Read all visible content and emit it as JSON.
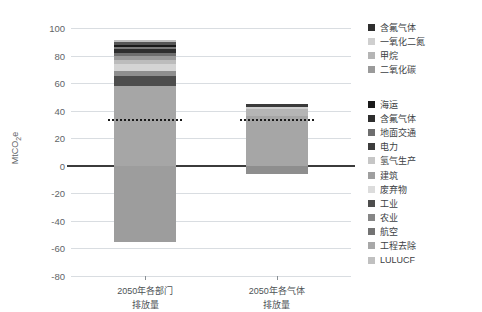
{
  "chart_data": {
    "type": "bar",
    "title": "",
    "subtitle": "",
    "xlabel": "",
    "ylabel": "MtCO2e",
    "ylim": [
      -80,
      100
    ],
    "yticks": [
      100,
      80,
      60,
      40,
      20,
      0,
      -20,
      -40,
      -60,
      -80
    ],
    "grid": true,
    "stacked": true,
    "legend_position": "right",
    "categories": [
      "2050年各部门\n排放量",
      "2050年各气体\n排放量"
    ],
    "annotations": [
      {
        "name": "net-emissions-line-sector",
        "label": "",
        "value": 34,
        "style": "dotted",
        "series": "2050年各部门排放量"
      },
      {
        "name": "net-emissions-line-gas",
        "label": "",
        "value": 34,
        "style": "dotted",
        "series": "2050年各气体排放量"
      }
    ],
    "bars": [
      {
        "name": "2050年各部门排放量",
        "x_label_line1": "2050年各部门",
        "x_label_line2": "排放量",
        "net_value": 34,
        "segments": [
          {
            "label": "工业",
            "value": 58.0,
            "y0": 0.0,
            "y1": 58.0,
            "color": "#a6a6a6"
          },
          {
            "label": "农业",
            "value": 7.0,
            "y0": 58.0,
            "y1": 65.0,
            "color": "#4d4d4d"
          },
          {
            "label": "废弃物",
            "value": 4.0,
            "y0": 65.0,
            "y1": 69.0,
            "color": "#8f8f8f"
          },
          {
            "label": "建筑",
            "value": 5.0,
            "y0": 69.0,
            "y1": 74.0,
            "color": "#d4d4d4"
          },
          {
            "label": "氢气生产",
            "value": 3.0,
            "y0": 74.0,
            "y1": 77.0,
            "color": "#bcbcbc"
          },
          {
            "label": "电力",
            "value": 3.0,
            "y0": 77.0,
            "y1": 80.0,
            "color": "#9a9a9a"
          },
          {
            "label": "地面交通",
            "value": 2.0,
            "y0": 80.0,
            "y1": 82.0,
            "color": "#6e6e6e"
          },
          {
            "label": "含氟气体",
            "value": 2.5,
            "y0": 82.0,
            "y1": 84.5,
            "color": "#2e2e2e"
          },
          {
            "label": "航空",
            "value": 2.0,
            "y0": 84.5,
            "y1": 86.5,
            "color": "#7b7b7b"
          },
          {
            "label": "海运",
            "value": 1.5,
            "y0": 86.5,
            "y1": 88.0,
            "color": "#1a1a1a"
          },
          {
            "label": "工程去除",
            "value": 1.5,
            "y0": 88.0,
            "y1": 89.5,
            "color": "#565656"
          },
          {
            "label": "LULUCF上",
            "value": 1.5,
            "y0": 89.5,
            "y1": 91.0,
            "color": "#c0c0c0"
          },
          {
            "label": "LULUCF",
            "value": -55.0,
            "y0": -55.0,
            "y1": 0.0,
            "color": "#9d9d9d"
          }
        ]
      },
      {
        "name": "2050年各气体排放量",
        "x_label_line1": "2050年各气体",
        "x_label_line2": "排放量",
        "net_value": 34,
        "segments": [
          {
            "label": "二氧化碳",
            "value": 36.0,
            "y0": 0.0,
            "y1": 36.0,
            "color": "#a6a6a6"
          },
          {
            "label": "甲烷",
            "value": 5.0,
            "y0": 36.0,
            "y1": 41.0,
            "color": "#b5b5b5"
          },
          {
            "label": "一氧化二氮",
            "value": 2.0,
            "y0": 41.0,
            "y1": 43.0,
            "color": "#cfcfcf"
          },
          {
            "label": "含氟气体",
            "value": 2.0,
            "y0": 43.0,
            "y1": 45.0,
            "color": "#3a3a3a"
          },
          {
            "label": "负排放",
            "value": -6.0,
            "y0": -6.0,
            "y1": 0.0,
            "color": "#8e8e8e"
          }
        ]
      }
    ],
    "legends": [
      {
        "name": "gas-legend",
        "items": [
          {
            "label": "含氟气体",
            "color": "#2e2e2e"
          },
          {
            "label": "一氧化二氮",
            "color": "#cfcfcf"
          },
          {
            "label": "甲烷",
            "color": "#b5b5b5"
          },
          {
            "label": "二氧化碳",
            "color": "#9a9a9a"
          }
        ]
      },
      {
        "name": "sector-legend",
        "items": [
          {
            "label": "海运",
            "color": "#1a1a1a"
          },
          {
            "label": "含氟气体",
            "color": "#2e2e2e"
          },
          {
            "label": "地面交通",
            "color": "#6e6e6e"
          },
          {
            "label": "电力",
            "color": "#3d3d3d"
          },
          {
            "label": "氢气生产",
            "color": "#c6c6c6"
          },
          {
            "label": "建筑",
            "color": "#9f9f9f"
          },
          {
            "label": "废弃物",
            "color": "#dcdcdc"
          },
          {
            "label": "工业",
            "color": "#4d4d4d"
          },
          {
            "label": "农业",
            "color": "#868686"
          },
          {
            "label": "航空",
            "color": "#737373"
          },
          {
            "label": "工程去除",
            "color": "#a8a8a8"
          },
          {
            "label": "LULUCF",
            "color": "#c0c0c0"
          }
        ]
      }
    ]
  },
  "axis": {
    "ylabel_prefix": "MtCO",
    "ylabel_sub": "2",
    "ylabel_suffix": "e"
  }
}
